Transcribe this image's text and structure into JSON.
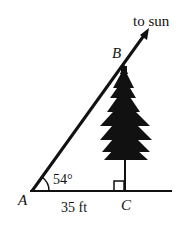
{
  "diagram": {
    "title_arrow_label": "to sun",
    "points": {
      "A": "A",
      "B": "B",
      "C": "C"
    },
    "angle_label": "54°",
    "base_label": "35 ft",
    "right_angle_at": "C",
    "object": "tree",
    "colors": {
      "ink": "#111111",
      "background": "#ffffff"
    }
  }
}
